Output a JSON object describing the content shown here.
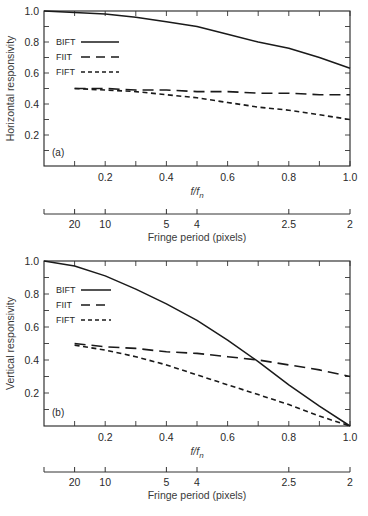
{
  "chart_data": [
    {
      "type": "line",
      "panel_label": "(a)",
      "title": "",
      "xlabel": "f/f_n",
      "ylabel": "Horizontal responsivity",
      "xlim": [
        0,
        1.0
      ],
      "ylim": [
        0,
        1.0
      ],
      "x_ticks": [
        0.1,
        0.2,
        0.3,
        0.4,
        0.5,
        0.6,
        0.7,
        0.8,
        0.9,
        1.0
      ],
      "x_tick_labels": [
        "0.2",
        "0.4",
        "0.6",
        "0.8",
        "1.0"
      ],
      "y_tick_labels": [
        "1.0",
        "0.8",
        "0.6",
        "0.4",
        "0.2"
      ],
      "grid": false,
      "legend_position": "upper left",
      "secondary_xaxis": {
        "label": "Fringe period (pixels)",
        "tick_labels": [
          "20",
          "10",
          "5",
          "4",
          "2.5",
          "2"
        ],
        "tick_positions_f": [
          0.1,
          0.2,
          0.4,
          0.5,
          0.8,
          1.0
        ]
      },
      "x": [
        0.0,
        0.1,
        0.2,
        0.3,
        0.4,
        0.5,
        0.6,
        0.7,
        0.8,
        0.9,
        1.0
      ],
      "series": [
        {
          "name": "BIFT",
          "style": "solid",
          "values": [
            1.0,
            0.99,
            0.98,
            0.96,
            0.93,
            0.9,
            0.85,
            0.8,
            0.76,
            0.7,
            0.63
          ]
        },
        {
          "name": "FIIT",
          "style": "long-dash",
          "values": [
            null,
            0.5,
            0.5,
            0.49,
            0.49,
            0.48,
            0.48,
            0.47,
            0.47,
            0.46,
            0.46
          ]
        },
        {
          "name": "FIFT",
          "style": "short-dash",
          "values": [
            null,
            0.5,
            0.49,
            0.48,
            0.46,
            0.44,
            0.41,
            0.38,
            0.36,
            0.33,
            0.3
          ]
        }
      ]
    },
    {
      "type": "line",
      "panel_label": "(b)",
      "title": "",
      "xlabel": "f/f_n",
      "ylabel": "Vertical responsivity",
      "xlim": [
        0,
        1.0
      ],
      "ylim": [
        0,
        1.0
      ],
      "x_ticks": [
        0.1,
        0.2,
        0.3,
        0.4,
        0.5,
        0.6,
        0.7,
        0.8,
        0.9,
        1.0
      ],
      "x_tick_labels": [
        "0.2",
        "0.4",
        "0.6",
        "0.8",
        "1.0"
      ],
      "y_tick_labels": [
        "1.0",
        "0.8",
        "0.6",
        "0.4",
        "0.2"
      ],
      "grid": false,
      "legend_position": "upper left",
      "secondary_xaxis": {
        "label": "Fringe period (pixels)",
        "tick_labels": [
          "20",
          "10",
          "5",
          "4",
          "2.5",
          "2"
        ],
        "tick_positions_f": [
          0.1,
          0.2,
          0.4,
          0.5,
          0.8,
          1.0
        ]
      },
      "x": [
        0.0,
        0.1,
        0.2,
        0.3,
        0.4,
        0.5,
        0.6,
        0.7,
        0.8,
        0.9,
        1.0
      ],
      "series": [
        {
          "name": "BIFT",
          "style": "solid",
          "values": [
            1.0,
            0.97,
            0.91,
            0.83,
            0.74,
            0.64,
            0.52,
            0.39,
            0.25,
            0.12,
            0.0
          ]
        },
        {
          "name": "FIIT",
          "style": "long-dash",
          "values": [
            null,
            0.5,
            0.48,
            0.47,
            0.45,
            0.44,
            0.42,
            0.4,
            0.37,
            0.34,
            0.3
          ]
        },
        {
          "name": "FIFT",
          "style": "short-dash",
          "values": [
            null,
            0.49,
            0.46,
            0.42,
            0.37,
            0.31,
            0.25,
            0.19,
            0.13,
            0.06,
            0.0
          ]
        }
      ]
    }
  ],
  "labels": {
    "panel_a": "(a)",
    "panel_b": "(b)",
    "ylabel_a": "Horizontal responsivity",
    "ylabel_b": "Vertical responsivity",
    "xlabel_main": "f/f",
    "xlabel_sub": "n",
    "fringe_label": "Fringe period (pixels)",
    "legend": [
      "BIFT",
      "FIIT",
      "FIFT"
    ],
    "y_ticks": [
      "1.0",
      "0.8",
      "0.6",
      "0.4",
      "0.2"
    ],
    "x_ticks": [
      "0.2",
      "0.4",
      "0.6",
      "0.8",
      "1.0"
    ],
    "fringe_ticks": [
      "20",
      "10",
      "5",
      "4",
      "2.5",
      "2"
    ]
  }
}
